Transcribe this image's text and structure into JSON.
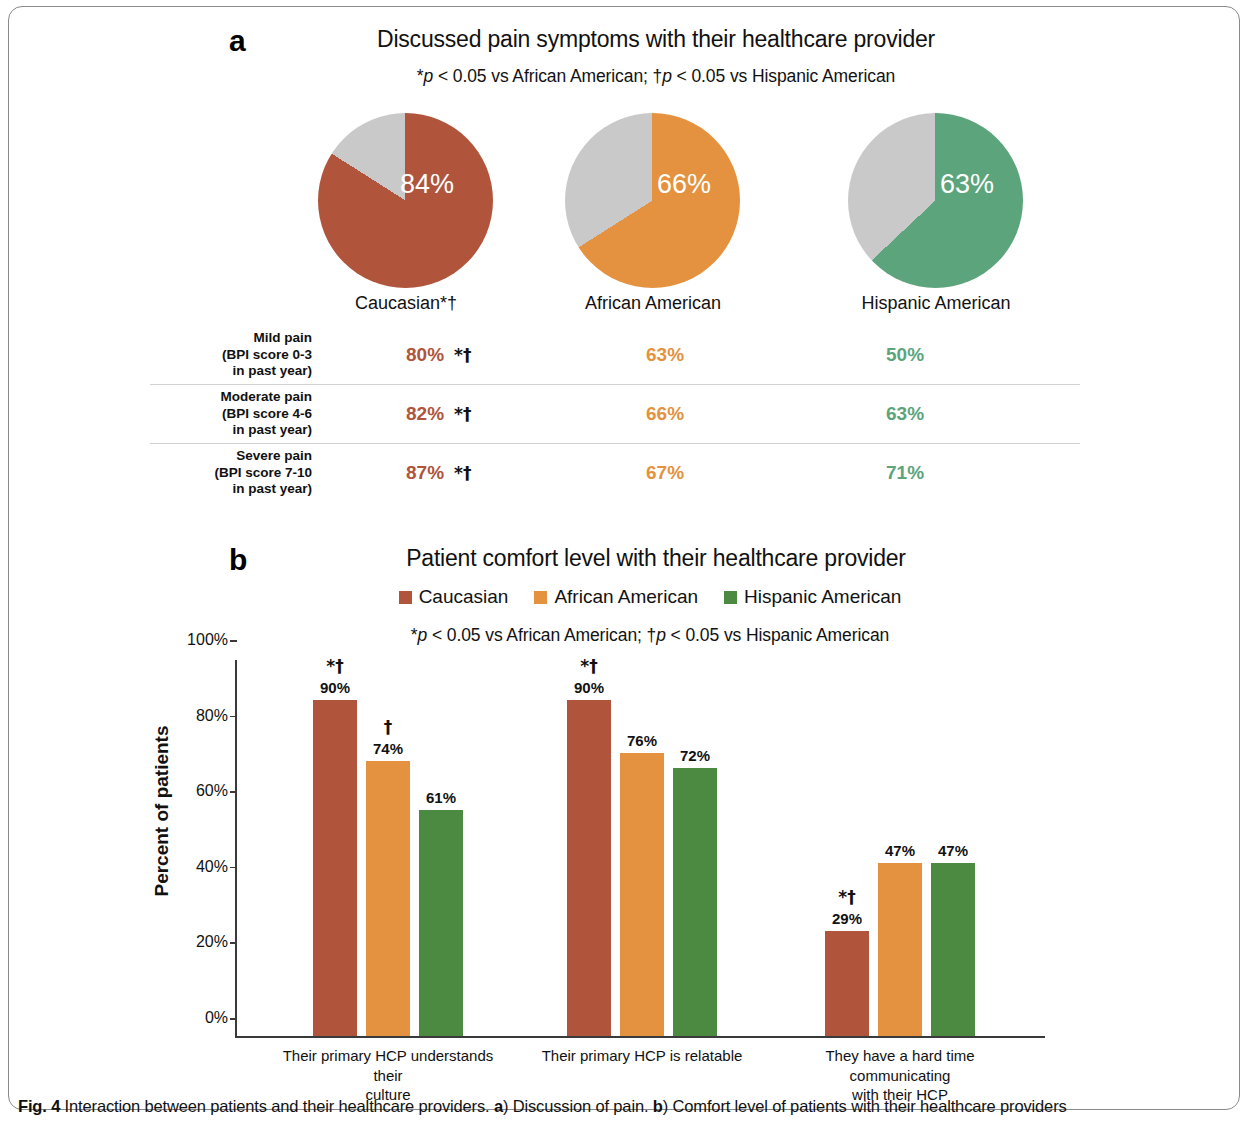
{
  "colors": {
    "caucasian": "#B0543C",
    "african_american": "#E49240",
    "hispanic_american_pie": "#5CA47C",
    "hispanic_american_bar": "#4C8A42",
    "remainder_gray": "#C9C9C9",
    "axis": "#3A3A3A"
  },
  "panel_a": {
    "letter": "a",
    "title": "Discussed pain symptoms with their healthcare provider",
    "note_prefix": "*",
    "note_p1": "p",
    "note_mid": " < 0.05 vs African American; †",
    "note_p2": "p",
    "note_suffix": " < 0.05 vs Hispanic American",
    "pies": [
      {
        "caption": "Caucasian*†",
        "value": 84,
        "label": "84%",
        "color_key": "caucasian"
      },
      {
        "caption": "African American",
        "value": 66,
        "label": "66%",
        "color_key": "african_american"
      },
      {
        "caption": "Hispanic American",
        "value": 63,
        "label": "63%",
        "color_key": "hispanic_american_pie"
      }
    ],
    "table": {
      "rows": [
        {
          "label_line1": "Mild pain",
          "label_line2": "(BPI score 0-3",
          "label_line3": "in past year)",
          "caucasian": "80%",
          "caucasian_sig": "*†",
          "african_american": "63%",
          "hispanic_american": "50%"
        },
        {
          "label_line1": "Moderate pain",
          "label_line2": "(BPI score 4-6",
          "label_line3": "in past year)",
          "caucasian": "82%",
          "caucasian_sig": "*†",
          "african_american": "66%",
          "hispanic_american": "63%"
        },
        {
          "label_line1": "Severe pain",
          "label_line2": "(BPI score 7-10",
          "label_line3": "in past year)",
          "caucasian": "87%",
          "caucasian_sig": "*†",
          "african_american": "67%",
          "hispanic_american": "71%"
        }
      ]
    }
  },
  "panel_b": {
    "letter": "b",
    "title": "Patient comfort level with their healthcare provider",
    "note_prefix": "*",
    "note_p1": "p",
    "note_mid": " < 0.05 vs African American; †",
    "note_p2": "p",
    "note_suffix": " < 0.05 vs Hispanic American",
    "legend": [
      {
        "label": "Caucasian",
        "color_key": "caucasian"
      },
      {
        "label": "African American",
        "color_key": "african_american"
      },
      {
        "label": "Hispanic American",
        "color_key": "hispanic_american_bar"
      }
    ]
  },
  "chart_data": {
    "type": "bar",
    "title": "Patient comfort level with their healthcare provider",
    "xlabel": "",
    "ylabel": "Percent of patients",
    "ylim": [
      0,
      100
    ],
    "yticks": [
      "0%",
      "20%",
      "40%",
      "60%",
      "80%",
      "100%"
    ],
    "ytick_values": [
      0,
      20,
      40,
      60,
      80,
      100
    ],
    "grid": false,
    "legend_position": "top",
    "categories": [
      "Their primary HCP understands their culture",
      "Their primary HCP is relatable",
      "They have a hard time communicating with their HCP"
    ],
    "category_lines": [
      [
        "Their primary HCP understands their",
        "culture"
      ],
      [
        "Their primary HCP is relatable",
        ""
      ],
      [
        "They have a hard time communicating",
        "with their HCP"
      ]
    ],
    "series": [
      {
        "name": "Caucasian",
        "color_key": "caucasian",
        "values": [
          90,
          90,
          29
        ],
        "labels": [
          "90%",
          "90%",
          "29%"
        ],
        "significance": [
          "*†",
          "*†",
          "*†"
        ]
      },
      {
        "name": "African American",
        "color_key": "african_american",
        "values": [
          74,
          76,
          47
        ],
        "labels": [
          "74%",
          "76%",
          "47%"
        ],
        "significance": [
          "†",
          "",
          ""
        ]
      },
      {
        "name": "Hispanic American",
        "color_key": "hispanic_american_bar",
        "values": [
          61,
          72,
          47
        ],
        "labels": [
          "61%",
          "72%",
          "47%"
        ],
        "significance": [
          "",
          "",
          ""
        ]
      }
    ]
  },
  "caption": {
    "fig_label": "Fig. 4",
    "text_1": " Interaction between patients and their healthcare providers. ",
    "a_label": "a",
    "text_2": ") Discussion of pain. ",
    "b_label": "b",
    "text_3": ") Comfort level of patients with their healthcare providers"
  }
}
